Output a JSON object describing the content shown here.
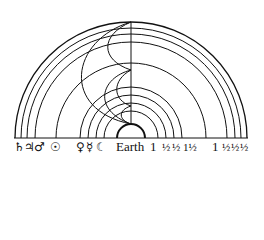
{
  "diagram": {
    "title": "",
    "center_label": "Earth",
    "spheres_left_symbols": [
      {
        "name": "Saturn",
        "glyph": "♄"
      },
      {
        "name": "Jupiter",
        "glyph": "♃"
      },
      {
        "name": "Mars",
        "glyph": "♂"
      },
      {
        "name": "Sun",
        "glyph": "☉"
      },
      {
        "name": "Venus",
        "glyph": "♀"
      },
      {
        "name": "Mercury",
        "glyph": "☿"
      },
      {
        "name": "Moon",
        "glyph": "☾"
      }
    ],
    "right_labels": {
      "earth_word": "Earth",
      "values": [
        "1",
        "½",
        "½",
        "1½",
        "1",
        "½",
        "½",
        "½"
      ]
    },
    "colors": {
      "line": "#111111",
      "background": "#ffffff"
    }
  }
}
